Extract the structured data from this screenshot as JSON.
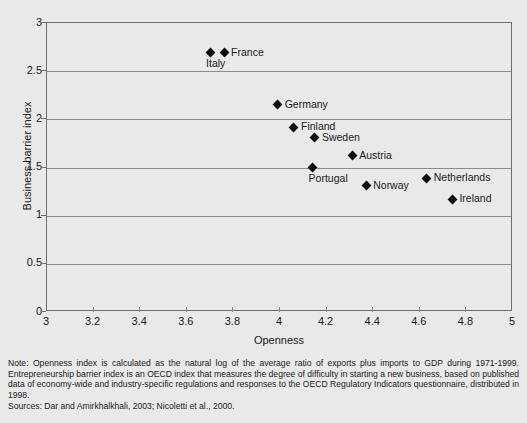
{
  "chart_data": {
    "type": "scatter",
    "title": "",
    "xlabel": "Openness",
    "ylabel": "Business barrier index",
    "xlim": [
      3,
      5
    ],
    "ylim": [
      0,
      3
    ],
    "xticks": [
      "3",
      "3.2",
      "3.4",
      "3.6",
      "3.8",
      "4",
      "4.2",
      "4.4",
      "4.6",
      "4.8",
      "5"
    ],
    "yticks": [
      "0",
      "0.5",
      "1",
      "1.5",
      "2",
      "2.5",
      "3"
    ],
    "grid": "horizontal",
    "legend": "none",
    "points": [
      {
        "label": "Italy",
        "x": 3.7,
        "y": 2.69,
        "label_pos": "below-left"
      },
      {
        "label": "France",
        "x": 3.76,
        "y": 2.69,
        "label_pos": "right"
      },
      {
        "label": "Germany",
        "x": 3.99,
        "y": 2.15,
        "label_pos": "right"
      },
      {
        "label": "Finland",
        "x": 4.06,
        "y": 1.92,
        "label_pos": "right"
      },
      {
        "label": "Sweden",
        "x": 4.15,
        "y": 1.81,
        "label_pos": "right"
      },
      {
        "label": "Austria",
        "x": 4.31,
        "y": 1.62,
        "label_pos": "right"
      },
      {
        "label": "Portugal",
        "x": 4.14,
        "y": 1.5,
        "label_pos": "below-left"
      },
      {
        "label": "Netherlands",
        "x": 4.63,
        "y": 1.39,
        "label_pos": "right"
      },
      {
        "label": "Norway",
        "x": 4.37,
        "y": 1.31,
        "label_pos": "right"
      },
      {
        "label": "Ireland",
        "x": 4.74,
        "y": 1.17,
        "label_pos": "right"
      }
    ]
  },
  "footnote": {
    "note": "Note: Openness index is calculated as the natural log of the average ratio of exports plus imports to GDP during 1971-1999. Entrepreneurship barrier index is an OECD index that measures the degree of difficulty in starting a new business, based on published data of economy-wide and industry-specific regulations and responses to the OECD Regulatory Indicators questionnaire, distributed in 1998.",
    "sources": "Sources: Dar and Amirkhalkhali, 2003; Nicoletti et al., 2000."
  },
  "colors": {
    "background": "#e9e9e9",
    "marker": "#0d0d0d",
    "axis": "#6e6e6e",
    "grid": "#8c8c8c",
    "text": "#1a1a1a"
  }
}
